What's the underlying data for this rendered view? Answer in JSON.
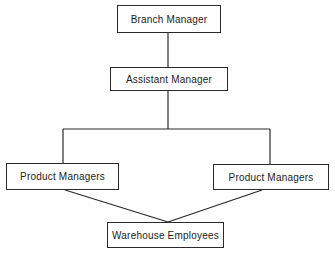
{
  "diagram": {
    "type": "org-chart",
    "nodes": [
      {
        "id": "branch-manager",
        "label": "Branch Manager"
      },
      {
        "id": "assistant-manager",
        "label": "Assistant Manager"
      },
      {
        "id": "product-managers-left",
        "label": "Product Managers"
      },
      {
        "id": "product-managers-right",
        "label": "Product Managers"
      },
      {
        "id": "warehouse-employees",
        "label": "Warehouse Employees"
      }
    ],
    "edges": [
      {
        "from": "branch-manager",
        "to": "assistant-manager"
      },
      {
        "from": "assistant-manager",
        "to": "product-managers-left"
      },
      {
        "from": "assistant-manager",
        "to": "product-managers-right"
      },
      {
        "from": "product-managers-left",
        "to": "warehouse-employees"
      },
      {
        "from": "product-managers-right",
        "to": "warehouse-employees"
      }
    ],
    "colors": {
      "line": "#2a2a2a",
      "background": "#ffffff"
    }
  }
}
